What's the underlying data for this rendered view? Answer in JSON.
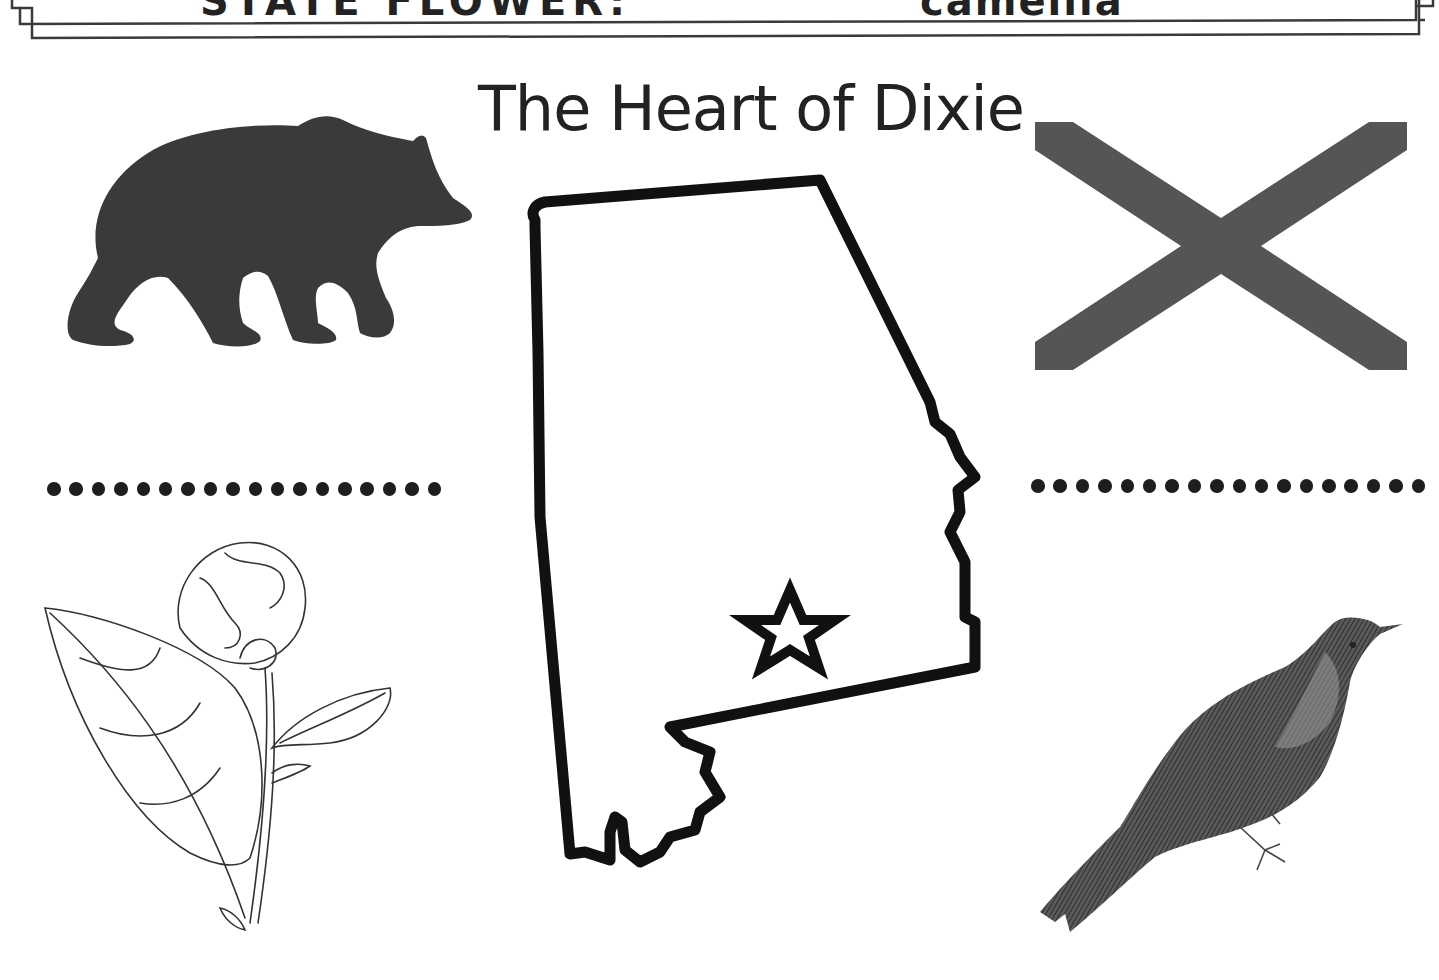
{
  "header": {
    "left_label": "STATE FLOWER:",
    "right_label": "camellia"
  },
  "title": "The Heart of Dixie",
  "illustrations": {
    "state_animal": "bear-silhouette",
    "state_flag": "saint-andrews-cross-flag",
    "state_map": "alabama-outline-with-capital-star",
    "state_flower": "camellia-line-drawing",
    "state_bird": "yellowhammer-bird-engraving"
  },
  "writing_lines": {
    "left_dot_count": 18,
    "right_dot_count": 18
  },
  "colors": {
    "ink": "#1e1e1e",
    "flag_cross": "#555555",
    "bear_fill": "#3a3a3a",
    "background": "#ffffff"
  }
}
